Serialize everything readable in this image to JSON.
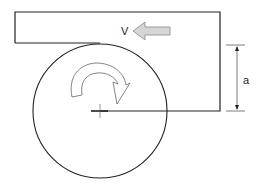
{
  "diagram": {
    "labels": {
      "velocity": "V",
      "dimension": "a"
    },
    "colors": {
      "stroke": "#222222",
      "arrow_fill": "#d0d0d0",
      "arrow_stroke": "#888888",
      "background": "#ffffff"
    },
    "elements": [
      "plate",
      "velocity-arrow",
      "wheel-circle",
      "rotation-arrow",
      "center-mark",
      "dimension-a"
    ]
  }
}
